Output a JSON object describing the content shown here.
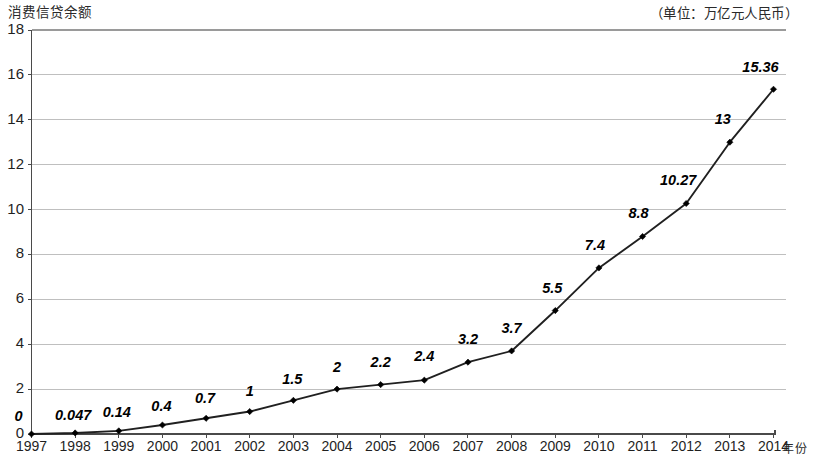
{
  "chart_data": {
    "type": "line",
    "title": "",
    "ylabel": "消费信贷余额",
    "xlabel": "年份",
    "unit_note": "（单位：万亿元人民币）",
    "ylim": [
      0,
      18
    ],
    "y_ticks": [
      0,
      2,
      4,
      6,
      8,
      10,
      12,
      14,
      16,
      18
    ],
    "y_tick_labels": [
      "0",
      "2",
      "4",
      "6",
      "8",
      "10",
      "12",
      "14",
      "16",
      "18"
    ],
    "grid": true,
    "legend": "none",
    "categories": [
      "1997",
      "1998",
      "1999",
      "2000",
      "2001",
      "2002",
      "2003",
      "2004",
      "2005",
      "2006",
      "2007",
      "2008",
      "2009",
      "2010",
      "2011",
      "2012",
      "2013",
      "2014"
    ],
    "values": [
      0,
      0.047,
      0.14,
      0.4,
      0.7,
      1,
      1.5,
      2,
      2.2,
      2.4,
      3.2,
      3.7,
      5.5,
      7.4,
      8.8,
      10.27,
      13,
      15.36
    ],
    "data_labels": [
      "0",
      "0.047",
      "0.14",
      "0.4",
      "0.7",
      "1",
      "1.5",
      "2",
      "2.2",
      "2.4",
      "3.2",
      "3.7",
      "5.5",
      "7.4",
      "8.8",
      "10.27",
      "13",
      "15.36"
    ],
    "series": [
      {
        "name": "消费信贷余额",
        "values": [
          0,
          0.047,
          0.14,
          0.4,
          0.7,
          1,
          1.5,
          2,
          2.2,
          2.4,
          3.2,
          3.7,
          5.5,
          7.4,
          8.8,
          10.27,
          13,
          15.36
        ],
        "line_color": "#202020",
        "marker": "diamond",
        "marker_color": "#000000"
      }
    ],
    "colors": {
      "line": "#202020",
      "marker": "#000000",
      "grid": "#b8b8b8",
      "axis": "#555555",
      "background": "#ffffff",
      "text": "#1a1a1a"
    }
  }
}
